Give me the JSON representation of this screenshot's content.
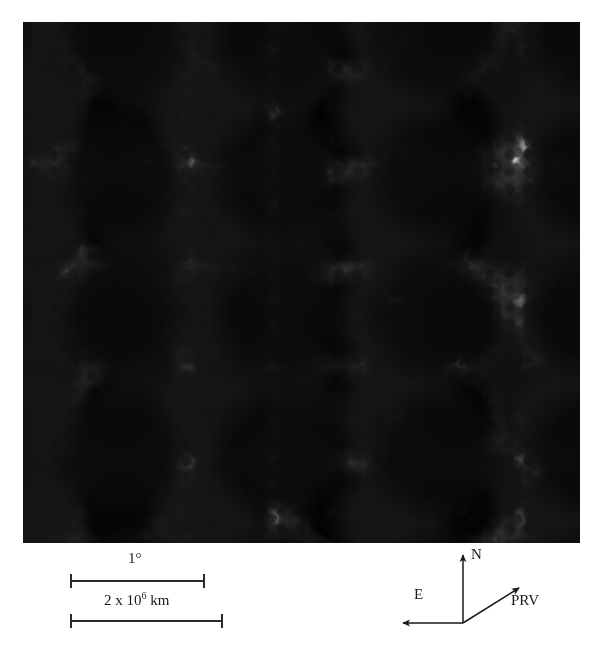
{
  "figure": {
    "kind": "astronomical-photographic-plate",
    "plate": {
      "left": 23,
      "top": 22,
      "width": 557,
      "height": 521,
      "background_color": "#c9c9c9",
      "ink_color": "#000000",
      "description": "Halftone reproduction of a photographic plate showing a comet with a dense dark coma at lower-left and a broad diffuse dust tail extending toward the upper-right across a crowded star field."
    },
    "features": [
      {
        "name": "coma",
        "label": "",
        "position": "lower-left",
        "tone": "very dark"
      },
      {
        "name": "nucleus",
        "label": "",
        "position": "lower-left",
        "tone": "black"
      },
      {
        "name": "dust-tail",
        "label": "",
        "position": "extends to upper-right",
        "tone": "diffuse gray"
      },
      {
        "name": "star-field",
        "label": "",
        "position": "full frame",
        "tone": "dark specks on light gray"
      }
    ]
  },
  "scale_bars": [
    {
      "id": "angular",
      "label": "1°",
      "label_plain": "1 degree",
      "x_start": 70,
      "x_end": 204,
      "y": 581,
      "label_x": 128,
      "label_y": 557
    },
    {
      "id": "linear",
      "label_prefix": "2 x 10",
      "label_exponent": "6",
      "label_suffix": "km",
      "label_plain": "2 x 10^6 km",
      "x_start": 70,
      "x_end": 222,
      "y": 621,
      "label_x": 104,
      "label_y": 594
    }
  ],
  "compass": {
    "origin": {
      "x": 463,
      "y": 623
    },
    "arrows": [
      {
        "name": "north-arrow",
        "label": "N",
        "tip": {
          "x": 463,
          "y": 553
        },
        "label_pos": {
          "x": 471,
          "y": 551
        }
      },
      {
        "name": "east-arrow",
        "label": "E",
        "tip": {
          "x": 403,
          "y": 623
        },
        "label_pos": {
          "x": 414,
          "y": 592
        }
      },
      {
        "name": "prv-arrow",
        "label": "PRV",
        "tip": {
          "x": 519,
          "y": 587
        },
        "label_pos": {
          "x": 511,
          "y": 593
        }
      }
    ],
    "notes": {
      "N": "celestial north",
      "E": "celestial east",
      "PRV": "projected radius vector (anti-sunward direction)"
    }
  },
  "colors": {
    "plate_background": "#c9c9c9",
    "annotation_ink": "#1a1a1a",
    "page_background": "#ffffff"
  }
}
